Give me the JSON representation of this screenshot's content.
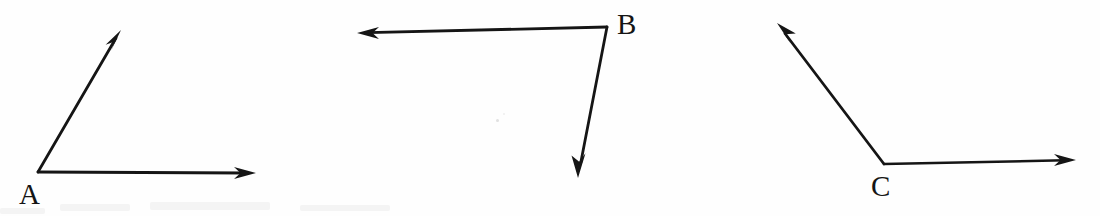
{
  "canvas": {
    "width": 1100,
    "height": 216,
    "background_color": "#fefefe",
    "ink_color": "#151515"
  },
  "figure": {
    "stroke_color": "#151515",
    "stroke_width": 2.6,
    "angles": [
      {
        "id": "angle-a",
        "vertex_label": "A",
        "vertex": {
          "x": 38,
          "y": 172
        },
        "label_position": {
          "x": 19,
          "y": 180
        },
        "rays": [
          {
            "name": "ray-a-up",
            "from": {
              "x": 38,
              "y": 172
            },
            "to": {
              "x": 121,
              "y": 30
            },
            "arrowhead": true
          },
          {
            "name": "ray-a-right",
            "from": {
              "x": 38,
              "y": 172
            },
            "to": {
              "x": 256,
              "y": 173
            },
            "arrowhead": true
          }
        ]
      },
      {
        "id": "angle-b",
        "vertex_label": "B",
        "vertex": {
          "x": 607,
          "y": 27
        },
        "label_position": {
          "x": 617,
          "y": 10
        },
        "rays": [
          {
            "name": "ray-b-left",
            "from": {
              "x": 607,
              "y": 27
            },
            "to": {
              "x": 357,
              "y": 33
            },
            "arrowhead": true
          },
          {
            "name": "ray-b-down",
            "from": {
              "x": 607,
              "y": 27
            },
            "to": {
              "x": 578,
              "y": 178
            },
            "arrowhead": true
          }
        ]
      },
      {
        "id": "angle-c",
        "vertex_label": "C",
        "vertex": {
          "x": 884,
          "y": 164
        },
        "label_position": {
          "x": 871,
          "y": 172
        },
        "rays": [
          {
            "name": "ray-c-upleft",
            "from": {
              "x": 884,
              "y": 164
            },
            "to": {
              "x": 777,
              "y": 23
            },
            "arrowhead": true
          },
          {
            "name": "ray-c-right",
            "from": {
              "x": 884,
              "y": 164
            },
            "to": {
              "x": 1076,
              "y": 160
            },
            "arrowhead": true
          }
        ]
      }
    ],
    "artifacts": [
      {
        "name": "scan-speck",
        "x": 496,
        "y": 119
      },
      {
        "name": "scan-speck",
        "x": 503,
        "y": 113
      }
    ]
  },
  "labels": {
    "a": "A",
    "b": "B",
    "c": "C"
  }
}
